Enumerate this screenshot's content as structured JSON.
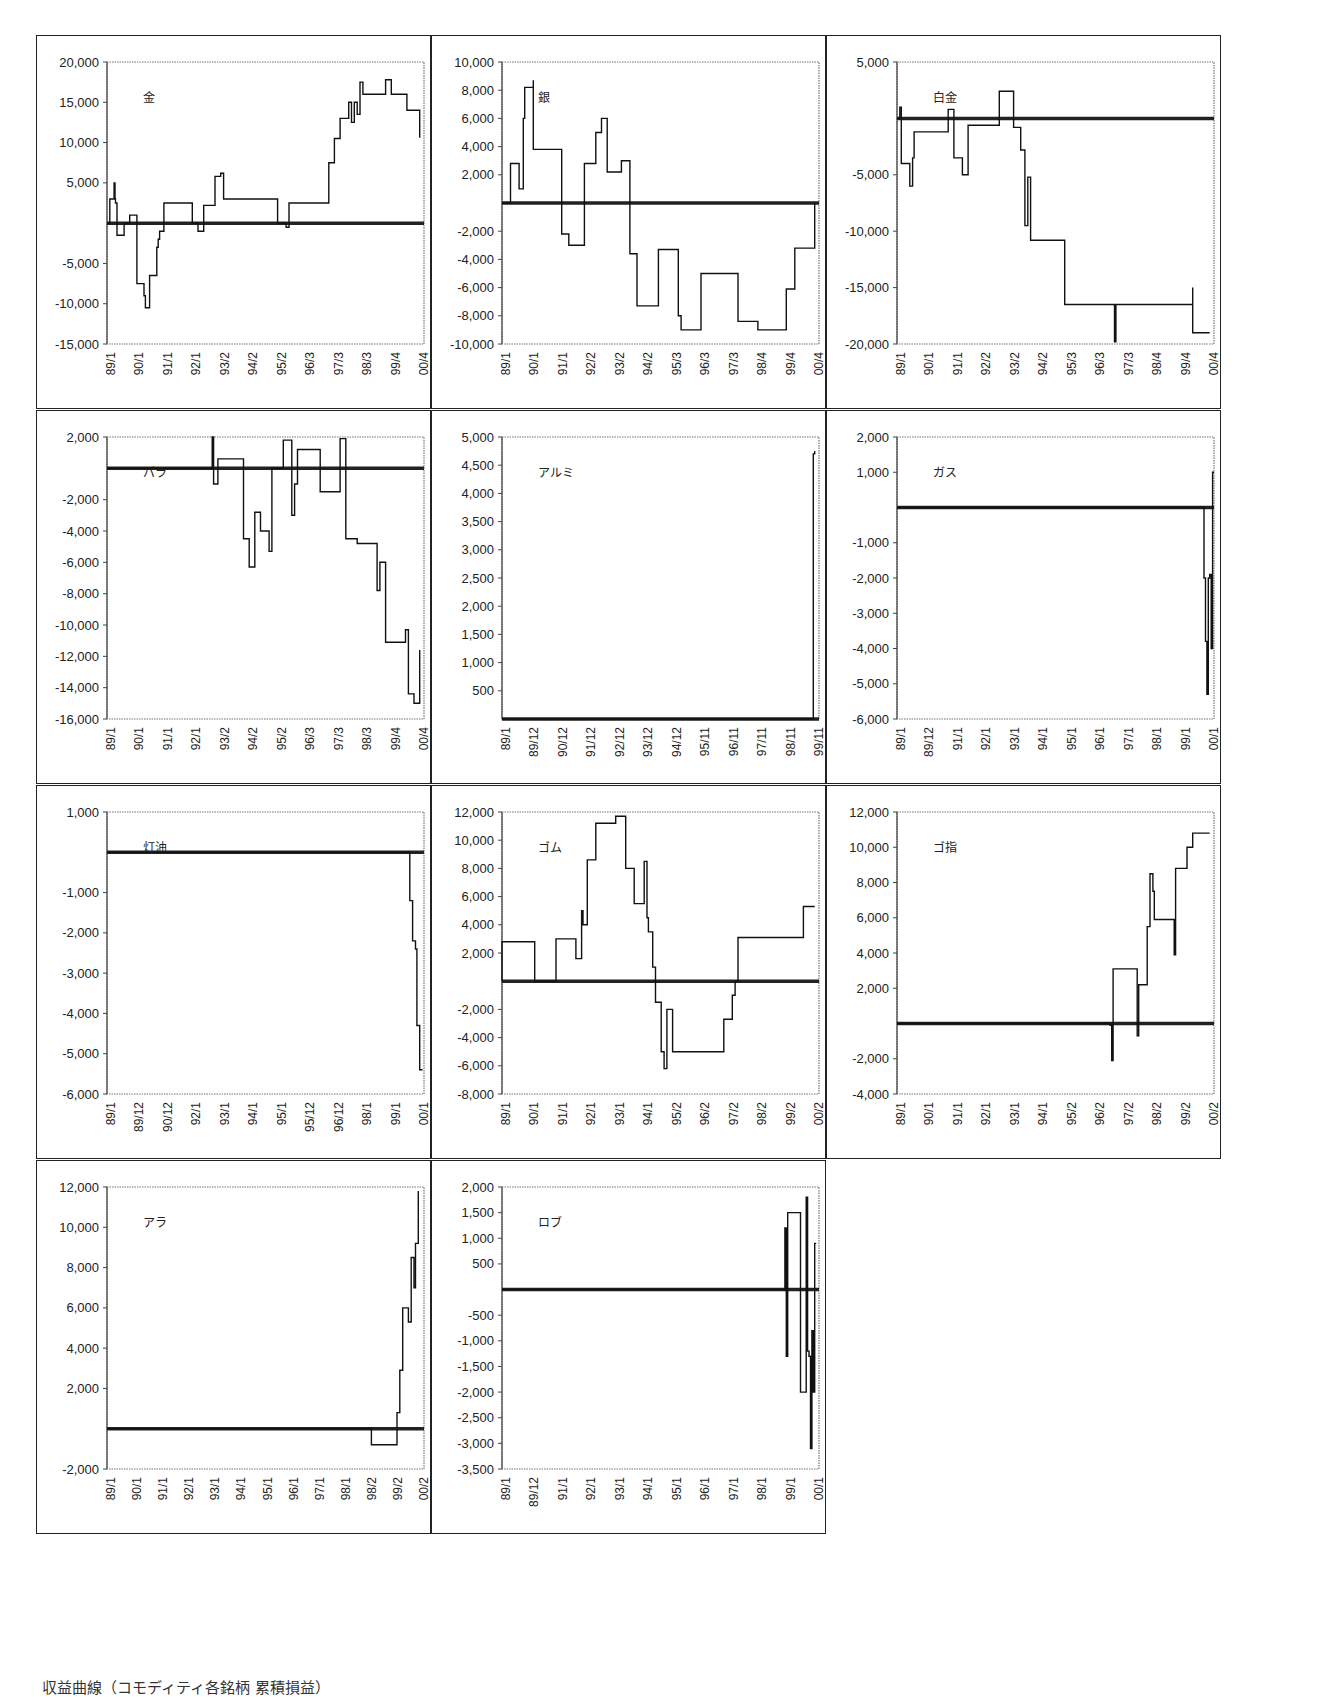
{
  "figure": {
    "caption": "収益曲線（コモディティ各銘柄 累積損益）"
  },
  "chart_data": [
    {
      "type": "line",
      "title": "金",
      "ylim": [
        -15000,
        20000
      ],
      "yticks": [
        20000,
        15000,
        10000,
        5000,
        -5000,
        -10000,
        -15000
      ],
      "xticks": [
        "89/1",
        "90/1",
        "91/1",
        "92/1",
        "93/2",
        "94/2",
        "95/2",
        "96/3",
        "97/3",
        "98/3",
        "99/4",
        "00/4"
      ],
      "zero_line": true,
      "series": [
        {
          "name": "金",
          "x": [
            0,
            0.1,
            0.2,
            0.25,
            0.28,
            0.3,
            0.35,
            0.45,
            0.6,
            0.75,
            0.8,
            1.05,
            1.1,
            1.15,
            1.3,
            1.35,
            1.5,
            1.7,
            1.75,
            1.8,
            1.85,
            2.0,
            2.2,
            2.3,
            2.4,
            2.5,
            2.6,
            2.8,
            3.0,
            3.2,
            3.4,
            3.6,
            3.8,
            4.0,
            4.1,
            4.3,
            4.4,
            4.7,
            4.75,
            5.0,
            5.5,
            6.0,
            6.3,
            6.4,
            6.5,
            6.7,
            7.0,
            7.2,
            7.25,
            7.5,
            7.8,
            8.0,
            8.2,
            8.4,
            8.5,
            8.6,
            8.7,
            8.8,
            8.9,
            9.0,
            9.5,
            9.6,
            9.8,
            10.0,
            10.5,
            10.55,
            10.8,
            11.0
          ],
          "y": [
            0,
            3000,
            3000,
            5000,
            3000,
            2500,
            -1500,
            -1500,
            0,
            0,
            1000,
            -7500,
            -7500,
            -7500,
            -9000,
            -10500,
            -6500,
            -6500,
            -3000,
            -2000,
            -1000,
            2500,
            2500,
            2500,
            2500,
            2500,
            2500,
            2500,
            0,
            -1000,
            2200,
            2200,
            5800,
            6200,
            3000,
            3000,
            3000,
            3000,
            3000,
            3000,
            3000,
            0,
            -500,
            2500,
            2500,
            2500,
            2500,
            2500,
            2500,
            2500,
            7500,
            10500,
            13000,
            13000,
            15000,
            12500,
            15000,
            13500,
            17500,
            16000,
            16000,
            16000,
            17800,
            16000,
            16000,
            14000,
            14000,
            10600
          ]
        }
      ]
    },
    {
      "type": "line",
      "title": "銀",
      "ylim": [
        -10000,
        10000
      ],
      "yticks": [
        10000,
        8000,
        6000,
        4000,
        2000,
        -2000,
        -4000,
        -6000,
        -8000,
        -10000
      ],
      "xticks": [
        "89/1",
        "90/1",
        "91/1",
        "92/2",
        "93/2",
        "94/2",
        "95/3",
        "96/3",
        "97/3",
        "98/4",
        "99/4",
        "00/4"
      ],
      "zero_line": true,
      "series": [
        {
          "name": "銀",
          "x": [
            0,
            0.3,
            0.3,
            0.55,
            0.6,
            0.75,
            0.8,
            1.0,
            1.1,
            1.1,
            1.9,
            2.0,
            2.1,
            2.3,
            2.35,
            2.9,
            2.9,
            3.1,
            3.3,
            3.45,
            3.5,
            3.7,
            3.8,
            3.8,
            4.2,
            4.5,
            4.7,
            4.75,
            5.0,
            5.5,
            5.5,
            6.2,
            6.3,
            6.3,
            7.0,
            7.3,
            7.3,
            7.5,
            8.0,
            8.3,
            8.3,
            8.5,
            9.0,
            9.0,
            10.0,
            10.0,
            10.3,
            11.0,
            11.0
          ],
          "y": [
            0,
            0,
            2800,
            2800,
            1000,
            6000,
            8200,
            8200,
            8700,
            3800,
            3800,
            3800,
            -2200,
            -2200,
            -3000,
            -500,
            2800,
            2800,
            5000,
            5000,
            6000,
            2200,
            2200,
            2200,
            3000,
            -3600,
            -3600,
            -7300,
            -7300,
            -3300,
            -3300,
            -8000,
            -8000,
            -9000,
            -5000,
            -5000,
            -5000,
            -5000,
            -5000,
            -8400,
            -8400,
            -8400,
            -8400,
            -9000,
            -6100,
            -6100,
            -3200,
            -3200,
            0
          ]
        }
      ]
    },
    {
      "type": "line",
      "title": "白金",
      "ylim": [
        -20000,
        5000
      ],
      "yticks": [
        5000,
        -5000,
        -10000,
        -15000,
        -20000
      ],
      "xticks": [
        "89/1",
        "90/1",
        "91/1",
        "92/2",
        "93/2",
        "94/2",
        "95/3",
        "96/3",
        "97/3",
        "98/4",
        "99/4",
        "00/4"
      ],
      "zero_line": true,
      "series": [
        {
          "name": "白金",
          "x": [
            0,
            0.1,
            0.15,
            0.4,
            0.45,
            0.55,
            0.6,
            0.6,
            1.7,
            1.8,
            2.0,
            2.1,
            2.3,
            2.5,
            2.5,
            3.1,
            3.4,
            3.6,
            3.7,
            4.1,
            4.2,
            4.35,
            4.45,
            4.5,
            4.6,
            4.7,
            5.1,
            5.6,
            5.7,
            5.8,
            5.9,
            5.9,
            6.0,
            7.6,
            7.65,
            7.7,
            7.8,
            10.2,
            10.4,
            10.4,
            11.0
          ],
          "y": [
            0,
            1000,
            -4000,
            -4000,
            -6000,
            -3500,
            -3500,
            -1200,
            -1200,
            800,
            -3500,
            -3500,
            -5000,
            -600,
            -600,
            -600,
            -600,
            2400,
            2400,
            -800,
            -800,
            -2800,
            -2800,
            -9500,
            -5200,
            -10800,
            -10800,
            -10800,
            -10800,
            -10800,
            -12000,
            -16500,
            -16500,
            -16500,
            -19800,
            -16500,
            -16500,
            -16500,
            -15000,
            -19000,
            -19000
          ]
        }
      ]
    },
    {
      "type": "line",
      "title": "パラ",
      "ylim": [
        -16000,
        2000
      ],
      "yticks": [
        2000,
        -2000,
        -4000,
        -6000,
        -8000,
        -10000,
        -12000,
        -14000,
        -16000
      ],
      "xticks": [
        "89/1",
        "90/1",
        "91/1",
        "92/1",
        "93/2",
        "94/2",
        "95/2",
        "96/3",
        "97/3",
        "98/3",
        "99/4",
        "00/4"
      ],
      "zero_line": true,
      "series": [
        {
          "name": "パラ",
          "x": [
            0,
            3.6,
            3.7,
            3.75,
            3.8,
            3.9,
            4.0,
            4.0,
            4.6,
            4.8,
            5.0,
            5.2,
            5.4,
            5.5,
            5.7,
            5.8,
            6.2,
            6.5,
            6.6,
            6.7,
            7.2,
            7.25,
            7.5,
            7.9,
            8.2,
            8.4,
            8.6,
            8.8,
            9.0,
            9.1,
            9.4,
            9.5,
            9.6,
            9.8,
            9.85,
            10.0,
            10.4,
            10.5,
            10.6,
            10.8,
            11.0
          ],
          "y": [
            0,
            0,
            2000,
            -1000,
            -1000,
            600,
            600,
            600,
            600,
            -4500,
            -6300,
            -2800,
            -4000,
            -4000,
            -5300,
            0,
            1800,
            -3000,
            -1000,
            1200,
            1200,
            1200,
            -1500,
            -1500,
            1900,
            -4500,
            -4500,
            -4800,
            -4800,
            -4800,
            -4800,
            -7800,
            -6000,
            -11100,
            -11100,
            -11100,
            -11100,
            -10300,
            -14400,
            -15000,
            -11600
          ]
        }
      ]
    },
    {
      "type": "line",
      "title": "アルミ",
      "ylim": [
        0,
        5000
      ],
      "yticks": [
        5000,
        4500,
        4000,
        3500,
        3000,
        2500,
        2000,
        1500,
        1000,
        500
      ],
      "xticks": [
        "89/1",
        "89/12",
        "90/12",
        "91/12",
        "92/12",
        "93/12",
        "94/12",
        "95/11",
        "96/11",
        "97/11",
        "98/11",
        "99/11"
      ],
      "zero_line": true,
      "series": [
        {
          "name": "アルミ",
          "x": [
            0,
            10.9,
            10.95,
            11.0
          ],
          "y": [
            0,
            0,
            4700,
            4750
          ]
        }
      ]
    },
    {
      "type": "line",
      "title": "ガス",
      "ylim": [
        -6000,
        2000
      ],
      "yticks": [
        2000,
        1000,
        -1000,
        -2000,
        -3000,
        -4000,
        -5000,
        -6000
      ],
      "xticks": [
        "89/1",
        "89/12",
        "91/1",
        "92/1",
        "93/1",
        "94/1",
        "95/1",
        "96/1",
        "97/1",
        "98/1",
        "99/1",
        "00/1"
      ],
      "zero_line": true,
      "series": [
        {
          "name": "ガス",
          "x": [
            0,
            10.75,
            10.8,
            10.85,
            10.9,
            10.95,
            11.0,
            11.05,
            11.1,
            11.15
          ],
          "y": [
            0,
            0,
            -2000,
            -3800,
            -5300,
            -2000,
            -1900,
            -4000,
            1000,
            1000
          ]
        }
      ]
    },
    {
      "type": "line",
      "title": "灯油",
      "ylim": [
        -6000,
        1000
      ],
      "yticks": [
        1000,
        -1000,
        -2000,
        -3000,
        -4000,
        -5000,
        -6000
      ],
      "xticks": [
        "89/1",
        "89/12",
        "90/12",
        "92/1",
        "93/1",
        "94/1",
        "95/1",
        "95/12",
        "96/12",
        "98/1",
        "99/1",
        "00/1"
      ],
      "zero_line": true,
      "series": [
        {
          "name": "灯油",
          "x": [
            0,
            10.6,
            10.65,
            10.75,
            10.85,
            10.9,
            11.0,
            11.1
          ],
          "y": [
            0,
            0,
            -1200,
            -2200,
            -2400,
            -4300,
            -5400,
            -5400
          ]
        }
      ]
    },
    {
      "type": "line",
      "title": "ゴム",
      "ylim": [
        -8000,
        12000
      ],
      "yticks": [
        12000,
        10000,
        8000,
        6000,
        4000,
        2000,
        -2000,
        -4000,
        -6000,
        -8000
      ],
      "xticks": [
        "89/1",
        "90/1",
        "91/1",
        "92/1",
        "93/1",
        "94/1",
        "95/2",
        "96/2",
        "97/2",
        "98/2",
        "99/2",
        "00/2"
      ],
      "zero_line": true,
      "series": [
        {
          "name": "ゴム",
          "x": [
            0,
            0,
            1.15,
            1.15,
            1.9,
            1.9,
            2.6,
            2.6,
            2.8,
            2.85,
            3.0,
            3.0,
            3.3,
            3.3,
            4.0,
            4.0,
            4.35,
            4.35,
            4.6,
            4.65,
            4.75,
            4.75,
            5.0,
            5.1,
            5.15,
            5.3,
            5.4,
            5.5,
            5.6,
            5.7,
            5.8,
            5.85,
            6.0,
            7.7,
            7.8,
            8.0,
            8.1,
            8.2,
            8.3,
            9.0,
            10.5,
            10.6,
            10.6,
            11.0
          ],
          "y": [
            0,
            2800,
            2800,
            0,
            0,
            3000,
            3000,
            1600,
            5000,
            4000,
            8600,
            8600,
            11200,
            11200,
            11200,
            11700,
            8000,
            8000,
            8000,
            5500,
            5500,
            5500,
            8500,
            4500,
            3500,
            1000,
            -1500,
            -1500,
            -5000,
            -6200,
            -2000,
            -2000,
            -5000,
            -5000,
            -2700,
            -2700,
            -1000,
            0,
            3100,
            3100,
            3100,
            5300,
            5300,
            5300
          ]
        }
      ]
    },
    {
      "type": "line",
      "title": "ゴ指",
      "ylim": [
        -4000,
        12000
      ],
      "yticks": [
        12000,
        10000,
        8000,
        6000,
        4000,
        2000,
        -2000,
        -4000
      ],
      "xticks": [
        "89/1",
        "90/1",
        "91/1",
        "92/1",
        "93/1",
        "94/1",
        "95/2",
        "96/2",
        "97/2",
        "98/2",
        "99/2",
        "00/2"
      ],
      "zero_line": true,
      "series": [
        {
          "name": "ゴ指",
          "x": [
            0,
            6.0,
            7.5,
            7.55,
            7.6,
            8.4,
            8.45,
            8.5,
            8.6,
            8.8,
            8.9,
            9.0,
            9.05,
            9.15,
            9.2,
            9.5,
            9.7,
            9.75,
            9.8,
            10.1,
            10.2,
            10.4,
            10.5,
            11.0
          ],
          "y": [
            0,
            0,
            -100,
            -2100,
            3100,
            3100,
            -700,
            2200,
            2200,
            5500,
            8500,
            7500,
            5900,
            5900,
            5900,
            5900,
            5900,
            3900,
            8800,
            8800,
            10000,
            10800,
            10800,
            10800
          ]
        }
      ]
    },
    {
      "type": "line",
      "title": "アラ",
      "ylim": [
        -2000,
        12000
      ],
      "yticks": [
        12000,
        10000,
        8000,
        6000,
        4000,
        2000,
        -2000
      ],
      "xticks": [
        "89/1",
        "90/1",
        "91/1",
        "92/1",
        "93/1",
        "94/1",
        "95/1",
        "96/1",
        "97/1",
        "98/1",
        "98/2",
        "99/2",
        "00/2"
      ],
      "zero_line": true,
      "series": [
        {
          "name": "アラ",
          "x": [
            0,
            9.3,
            9.3,
            10.2,
            10.2,
            10.3,
            10.35,
            10.4,
            10.45,
            10.6,
            10.6,
            10.7,
            10.8,
            10.85,
            10.95
          ],
          "y": [
            0,
            0,
            -800,
            -800,
            800,
            2900,
            2900,
            6000,
            6000,
            6000,
            5300,
            8500,
            7000,
            9200,
            11800
          ]
        }
      ]
    },
    {
      "type": "line",
      "title": "ロブ",
      "ylim": [
        -3500,
        2000
      ],
      "yticks": [
        2000,
        1500,
        1000,
        500,
        -500,
        -1000,
        -1500,
        -2000,
        -2500,
        -3000,
        -3500
      ],
      "xticks": [
        "89/1",
        "89/12",
        "91/1",
        "92/1",
        "93/1",
        "94/1",
        "95/1",
        "96/1",
        "97/1",
        "98/1",
        "99/1",
        "00/1"
      ],
      "zero_line": true,
      "series": [
        {
          "name": "ロブ",
          "x": [
            0,
            9.9,
            9.95,
            10.0,
            10.05,
            10.05,
            10.5,
            10.5,
            10.6,
            10.6,
            10.7,
            10.75,
            10.8,
            10.85,
            10.9,
            10.95,
            11.0,
            11.05
          ],
          "y": [
            0,
            0,
            1200,
            -1300,
            1000,
            1500,
            1500,
            -2000,
            -2000,
            -2000,
            1800,
            -1200,
            -1300,
            -3100,
            -800,
            -2000,
            900,
            900
          ]
        }
      ]
    }
  ]
}
